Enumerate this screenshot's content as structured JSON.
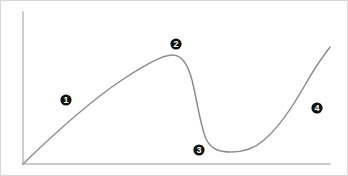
{
  "figure": {
    "background_color": "#ffffff",
    "border_color": "#d8d8d8",
    "width": 348,
    "height": 176
  },
  "axes": {
    "axis_color": "#b9b9b9",
    "y_axis": {
      "name": "y-axis",
      "x": 23,
      "y_top": 12,
      "y_bottom": 164
    },
    "x_axis": {
      "name": "x-axis",
      "y": 164,
      "x_left": 23,
      "x_right": 330
    },
    "ticks": [],
    "tick_labels": [],
    "xlabel": "",
    "ylabel": ""
  },
  "curve": {
    "name": "phase-curve",
    "color": "#8d8d8d",
    "stroke_width": 1.5,
    "path": "M 23,164 C 60,128 95,98 122,80 C 146,64 163,55 172,55 C 181,55 187,62 192,80 C 197,100 200,124 206,139 C 211,149 219,152 231,152 C 243,152 254,149 264,140 C 278,128 292,108 305,85 C 315,67 324,55 330,47"
  },
  "chart_data": {
    "type": "line",
    "subtitle": "",
    "xlabel": "",
    "ylabel": "",
    "grid": false,
    "legend": false,
    "xlim": [
      0,
      1
    ],
    "ylim": [
      0,
      1
    ],
    "series": [
      {
        "name": "phase-curve",
        "color": "#8d8d8d",
        "x": [
          0.0,
          0.13,
          0.23,
          0.32,
          0.42,
          0.49,
          0.55,
          0.6,
          0.65,
          0.68,
          0.72,
          0.78,
          0.84,
          0.92,
          1.0
        ],
        "y": [
          0.0,
          0.25,
          0.43,
          0.55,
          0.66,
          0.72,
          0.72,
          0.63,
          0.42,
          0.23,
          0.16,
          0.16,
          0.23,
          0.46,
          0.77
        ]
      }
    ],
    "annotations": [
      {
        "label": "1",
        "x": 0.14,
        "y": 0.42,
        "style": "filled-circle-white-text"
      },
      {
        "label": "2",
        "x": 0.5,
        "y": 0.79,
        "style": "filled-circle-white-text"
      },
      {
        "label": "3",
        "x": 0.57,
        "y": 0.09,
        "style": "filled-circle-white-text"
      },
      {
        "label": "4",
        "x": 0.96,
        "y": 0.37,
        "style": "filled-circle-white-text"
      }
    ]
  },
  "markers": {
    "disc_color": "#111111",
    "text_color": "#ffffff",
    "radius": 5.6,
    "items": [
      {
        "id": "marker-1",
        "label": "1",
        "cx": 66,
        "cy": 100
      },
      {
        "id": "marker-2",
        "label": "2",
        "cx": 176,
        "cy": 44
      },
      {
        "id": "marker-3",
        "label": "3",
        "cx": 199,
        "cy": 150
      },
      {
        "id": "marker-4",
        "label": "4",
        "cx": 317,
        "cy": 108
      }
    ]
  }
}
